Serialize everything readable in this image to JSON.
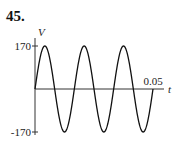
{
  "problem_number": "45.",
  "chart_data": {
    "type": "line",
    "title": "",
    "xlabel": "t",
    "ylabel": "V",
    "x_ticks": [
      "0.05"
    ],
    "y_ticks": [
      "170",
      "-170"
    ],
    "xlim": [
      0,
      0.05
    ],
    "ylim": [
      -170,
      170
    ],
    "series": [
      {
        "name": "V(t)",
        "function": "170 sin(120 pi t)",
        "amplitude": 170,
        "periods": 3,
        "x": [
          0,
          0.00417,
          0.00833,
          0.0125,
          0.01667,
          0.02083,
          0.025,
          0.02917,
          0.03333,
          0.0375,
          0.04167,
          0.04583,
          0.05
        ],
        "values": [
          0,
          170,
          0,
          -170,
          0,
          170,
          0,
          -170,
          0,
          170,
          0,
          -170,
          0
        ]
      }
    ],
    "grid": false,
    "legend": null
  }
}
